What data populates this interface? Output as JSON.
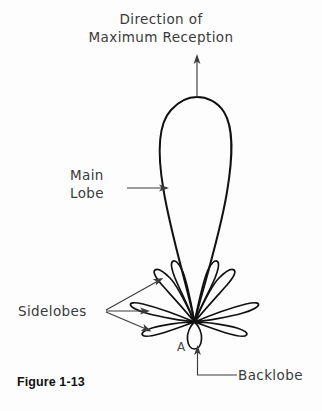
{
  "figure": {
    "caption": "Figure 1-13",
    "title_line1": "Direction of",
    "title_line2": "Maximum Reception",
    "labels": {
      "main_lobe_line1": "Main",
      "main_lobe_line2": "Lobe",
      "sidelobes": "Sidelobes",
      "backlobe": "Backlobe",
      "point_a": "A"
    },
    "colors": {
      "background": "#fdfdfd",
      "lobe_stroke": "#111111",
      "leader_stroke": "#3c3c3c",
      "annotation_text": "#3a3a3a",
      "caption_text": "#111111"
    },
    "diagram_type": "antenna-radiation-pattern",
    "icons": {
      "direction_arrow": "up-arrow-icon",
      "main_lobe_pointer": "right-arrow-icon",
      "sidelobe_pointer_upper": "arrow-icon",
      "sidelobe_pointer_middle": "arrow-icon",
      "sidelobe_pointer_lower": "arrow-icon",
      "backlobe_pointer": "elbow-arrow-icon"
    }
  }
}
